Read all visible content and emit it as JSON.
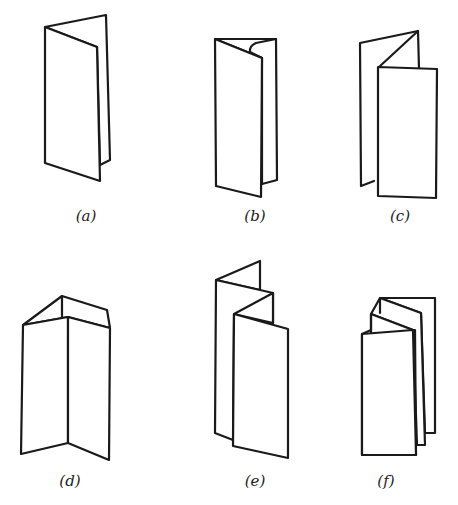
{
  "diagram": {
    "type": "paper folding styles",
    "stroke_color": "#1a1a1a",
    "background": "#ffffff",
    "panels": [
      {
        "id": "a",
        "label": "(a)",
        "description": "single fold (two panels)"
      },
      {
        "id": "b",
        "label": "(b)",
        "description": "letter fold (three panels, wrapped)"
      },
      {
        "id": "c",
        "label": "(c)",
        "description": "gate/open fold with front panel"
      },
      {
        "id": "d",
        "label": "(d)",
        "description": "three panel standing fold"
      },
      {
        "id": "e",
        "label": "(e)",
        "description": "zigzag accordion fold (four panels)"
      },
      {
        "id": "f",
        "label": "(f)",
        "description": "multi-panel accordion fold"
      }
    ]
  }
}
